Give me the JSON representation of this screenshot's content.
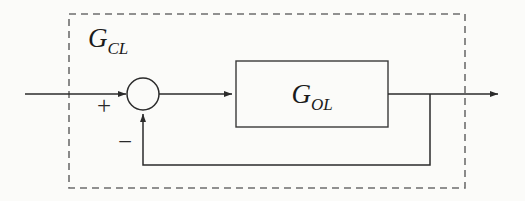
{
  "diagram": {
    "type": "control-system-block-diagram",
    "background_color": "#fbfbf9",
    "line_color": "#2b2b2b",
    "boundary": {
      "label_base": "G",
      "label_subscript": "CL",
      "label_full": "G_CL",
      "style": "dashed",
      "color": "#6e6e6e",
      "x": 69,
      "y": 14,
      "width": 396,
      "height": 174
    },
    "blocks": [
      {
        "name": "open-loop-block",
        "label_base": "G",
        "label_subscript": "OL",
        "label_full": "G_OL",
        "style": "solid-rectangle",
        "color": "#3a3a3a",
        "x": 236,
        "y": 61,
        "width": 152,
        "height": 66
      }
    ],
    "summing_junction": {
      "name": "summing-junction",
      "shape": "circle",
      "cx": 143,
      "cy": 94,
      "r": 16,
      "inputs": [
        {
          "port": "left",
          "sign": "+",
          "sign_x": 104,
          "sign_y": 114
        },
        {
          "port": "bottom",
          "sign": "−",
          "sign_x": 125,
          "sign_y": 141
        }
      ]
    },
    "signals": [
      {
        "name": "reference-input-line",
        "from_x": 25,
        "from_y": 94,
        "to_x": 128,
        "to_y": 94,
        "arrow": true
      },
      {
        "name": "error-signal-line",
        "from_x": 159,
        "from_y": 94,
        "to_x": 234,
        "to_y": 94,
        "arrow": true
      },
      {
        "name": "output-line",
        "from_x": 388,
        "from_y": 94,
        "to_x": 500,
        "to_y": 94,
        "arrow": true
      },
      {
        "name": "feedback-tap-down",
        "from_x": 430,
        "from_y": 94,
        "to_x": 430,
        "to_y": 165,
        "arrow": false
      },
      {
        "name": "feedback-horizontal",
        "from_x": 430,
        "from_y": 165,
        "to_x": 143,
        "to_y": 165,
        "arrow": false
      },
      {
        "name": "feedback-up-to-sum",
        "from_x": 143,
        "from_y": 165,
        "to_x": 143,
        "to_y": 112,
        "arrow": true
      }
    ]
  }
}
